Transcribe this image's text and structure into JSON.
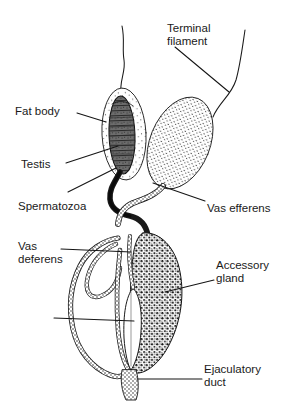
{
  "figure": {
    "background_color": "#ffffff",
    "ink_color": "#1a1a1a",
    "width": 296,
    "height": 409
  },
  "labels": [
    {
      "id": "terminal-filament",
      "text": "Terminal\nfilament",
      "x": 167,
      "y": 22,
      "points_to": "terminal-filament-strand"
    },
    {
      "id": "fat-body",
      "text": "Fat body",
      "x": 15,
      "y": 105,
      "points_to": "fat-body-sheath"
    },
    {
      "id": "testis",
      "text": "Testis",
      "x": 21,
      "y": 158,
      "points_to": "testis-follicles"
    },
    {
      "id": "spermatozoa",
      "text": "Spermatozoa",
      "x": 18,
      "y": 200,
      "points_to": "sperm-duct"
    },
    {
      "id": "vas-efferens",
      "text": "Vas efferens",
      "x": 207,
      "y": 202,
      "points_to": "vas-efferens-tube"
    },
    {
      "id": "vas-deferens",
      "text": "Vas\ndeferens",
      "x": 18,
      "y": 240,
      "points_to": "vas-deferens-coil"
    },
    {
      "id": "accessory-gland",
      "text": "Accessory\ngland",
      "x": 216,
      "y": 259,
      "points_to": "accessory-gland-mass"
    },
    {
      "id": "ejaculatory-duct",
      "text": "Ejaculatory\nduct",
      "x": 204,
      "y": 363,
      "points_to": "ejaculatory-duct-outlet"
    }
  ],
  "unlabeled_leaders": [
    {
      "id": "seminal-vesicle-leader",
      "from_x": 54,
      "from_y": 318,
      "to_x": 134,
      "to_y": 321
    }
  ],
  "structures": [
    {
      "id": "terminal-filament-strand",
      "name": "terminal filament",
      "style": "thin wavy line",
      "fill": "none"
    },
    {
      "id": "fat-body-sheath",
      "name": "fat body",
      "style": "light stipple ellipse",
      "fill": "#f7f7f7"
    },
    {
      "id": "testis-follicles",
      "name": "testis",
      "style": "dark hatched ellipse",
      "fill": "#5a5a5a"
    },
    {
      "id": "right-testis-lobe",
      "name": "right testis lobe",
      "style": "medium stipple tilted ellipse",
      "fill": "#ededed"
    },
    {
      "id": "sperm-duct",
      "name": "spermatozoa duct",
      "style": "thick dark curve",
      "fill": "#262626"
    },
    {
      "id": "vas-efferens-tube",
      "name": "vas efferens",
      "style": "stippled tube",
      "fill": "#f0f0f0"
    },
    {
      "id": "vas-deferens-coil",
      "name": "vas deferens",
      "style": "stippled coiled loop",
      "fill": "#fbfbfb"
    },
    {
      "id": "accessory-gland-mass",
      "name": "accessory gland",
      "style": "dense coarse stipple mass",
      "fill": "#dcdcdc"
    },
    {
      "id": "seminal-vesicle-spindle",
      "name": "seminal vesicle",
      "style": "white spindle",
      "fill": "#ffffff"
    },
    {
      "id": "ejaculatory-duct-outlet",
      "name": "ejaculatory duct",
      "style": "short stippled outlet",
      "fill": "#e8e8e8"
    }
  ]
}
